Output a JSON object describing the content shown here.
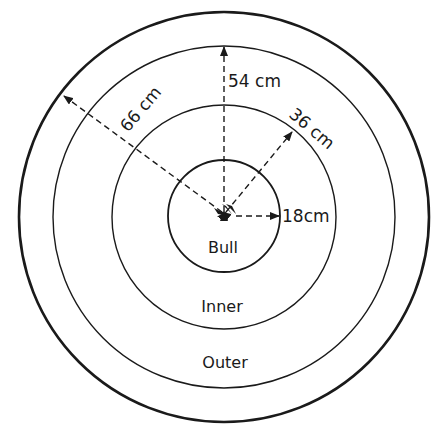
{
  "diagram": {
    "colors": {
      "line": "#1a1a1a",
      "background": "#ffffff"
    },
    "rings": [
      {
        "name": "Bull",
        "radius_label": "18cm"
      },
      {
        "name": "Inner",
        "radius_label": "36 cm"
      },
      {
        "name": "Outer",
        "radius_label": "54 cm"
      },
      {
        "name": "Outer boundary",
        "radius_label": "66 cm"
      }
    ],
    "zone_labels": {
      "bull": "Bull",
      "inner": "Inner",
      "outer": "Outer"
    },
    "dimension_labels": {
      "r66": "66 cm",
      "r54": "54 cm",
      "r36": "36 cm",
      "r18": "18cm"
    }
  }
}
